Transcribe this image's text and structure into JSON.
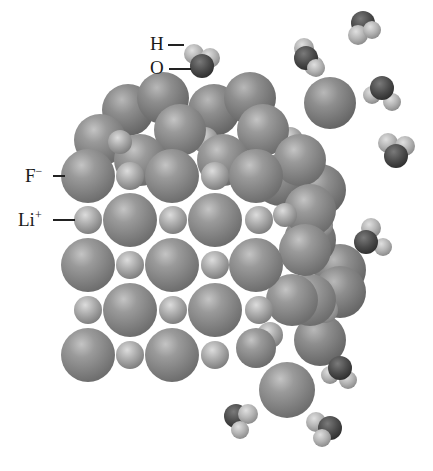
{
  "diagram": {
    "labels": {
      "hydrogen": "H",
      "oxygen": "O",
      "fluoride": "F",
      "fluoride_charge": "−",
      "lithium": "Li",
      "lithium_charge": "+"
    },
    "colors": {
      "fluoride_ion": "#8a8a8a",
      "lithium_ion": "#a8a8a8",
      "oxygen_atom": "#4a4a4a",
      "hydrogen_atom": "#b5b5b5",
      "background": "#ffffff"
    }
  }
}
